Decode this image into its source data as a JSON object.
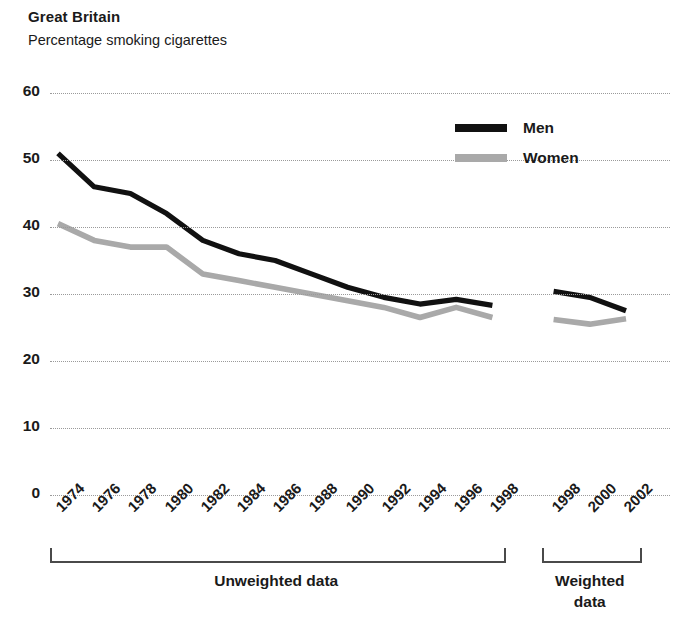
{
  "header": {
    "title": "Great Britain",
    "subtitle": "Percentage smoking cigarettes"
  },
  "legend": {
    "men_label": "Men",
    "women_label": "Women"
  },
  "groups": {
    "unweighted_label": "Unweighted data",
    "weighted_label_line1": "Weighted",
    "weighted_label_line2": "data"
  },
  "colors": {
    "men": "#111111",
    "women": "#a9a9a9",
    "grid": "#9a9a9a",
    "axis": "#4a4a4a",
    "text": "#1a1a1a"
  },
  "chart_data": {
    "type": "line",
    "title": "Great Britain",
    "subtitle": "Percentage smoking cigarettes",
    "xlabel": "",
    "ylabel": "",
    "ylim": [
      0,
      60
    ],
    "yticks": [
      0,
      10,
      20,
      30,
      40,
      50,
      60
    ],
    "ytick_labels": [
      "0",
      "10",
      "20",
      "30",
      "40",
      "50",
      "60"
    ],
    "grid": "horizontal-dotted",
    "legend_position": "top-right",
    "categories": [
      "1974",
      "1976",
      "1978",
      "1980",
      "1982",
      "1984",
      "1986",
      "1988",
      "1990",
      "1992",
      "1994",
      "1996",
      "1998",
      "1998",
      "2000",
      "2002"
    ],
    "x_tick_labels": [
      "1974",
      "1976",
      "1978",
      "1980",
      "1982",
      "1984",
      "1986",
      "1988",
      "1990",
      "1992",
      "1994",
      "1996",
      "1998",
      "1998",
      "2000",
      "2002"
    ],
    "segments": [
      {
        "name": "Unweighted data",
        "x": [
          "1974",
          "1976",
          "1978",
          "1980",
          "1982",
          "1984",
          "1986",
          "1988",
          "1990",
          "1992",
          "1994",
          "1996",
          "1998"
        ],
        "series": [
          {
            "name": "Men",
            "values": [
              51.0,
              46.0,
              45.0,
              42.0,
              38.0,
              36.0,
              35.0,
              33.0,
              31.0,
              29.5,
              28.5,
              29.2,
              28.3
            ]
          },
          {
            "name": "Women",
            "values": [
              40.5,
              38.0,
              37.0,
              37.0,
              33.0,
              32.0,
              31.0,
              30.0,
              29.0,
              28.0,
              26.5,
              28.0,
              26.5
            ]
          }
        ]
      },
      {
        "name": "Weighted data",
        "x": [
          "1998",
          "2000",
          "2002"
        ],
        "series": [
          {
            "name": "Men",
            "values": [
              30.4,
              29.5,
              27.5
            ]
          },
          {
            "name": "Women",
            "values": [
              26.2,
              25.5,
              26.3
            ]
          }
        ]
      }
    ],
    "series": [
      {
        "name": "Men",
        "values": [
          51.0,
          46.0,
          45.0,
          42.0,
          38.0,
          36.0,
          35.0,
          33.0,
          31.0,
          29.5,
          28.5,
          29.2,
          28.3,
          30.4,
          29.5,
          27.5
        ]
      },
      {
        "name": "Women",
        "values": [
          40.5,
          38.0,
          37.0,
          37.0,
          33.0,
          32.0,
          31.0,
          30.0,
          29.0,
          28.0,
          26.5,
          28.0,
          26.5,
          26.2,
          25.5,
          26.3
        ]
      }
    ]
  }
}
